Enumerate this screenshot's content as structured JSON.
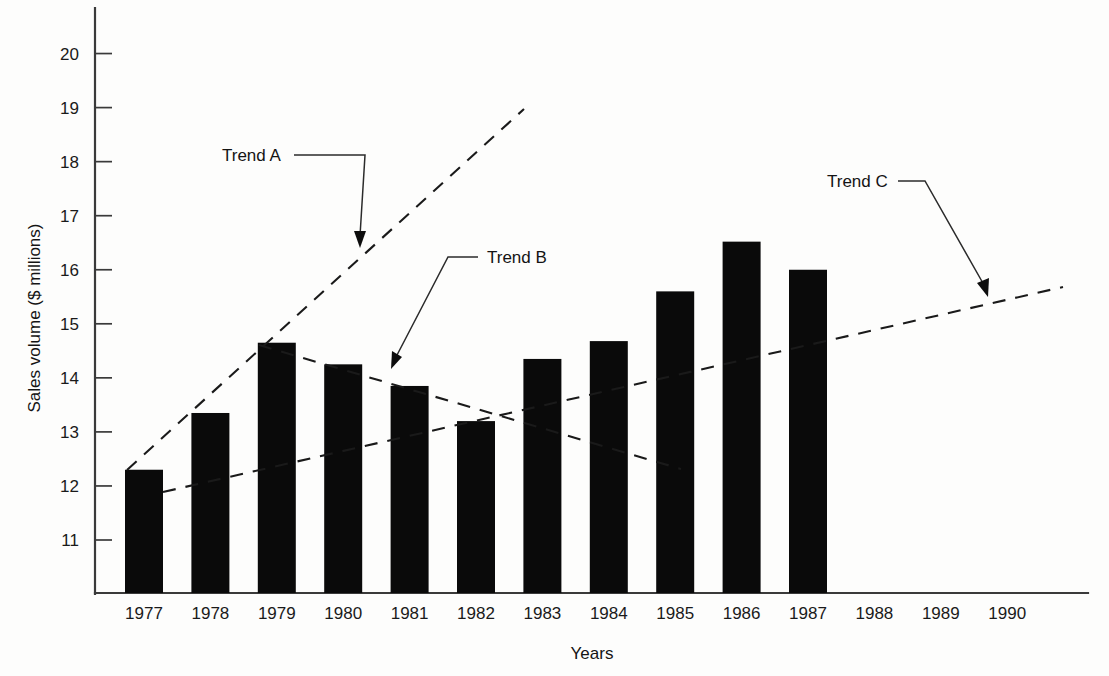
{
  "chart_data": {
    "type": "bar",
    "title": "",
    "xlabel": "Years",
    "ylabel": "Sales volume ($ millions)",
    "categories": [
      "1977",
      "1978",
      "1979",
      "1980",
      "1981",
      "1982",
      "1983",
      "1984",
      "1985",
      "1986",
      "1987",
      "1988",
      "1989",
      "1990"
    ],
    "values": [
      12.3,
      13.35,
      14.65,
      14.25,
      13.85,
      13.2,
      14.35,
      14.68,
      15.6,
      16.52,
      16.0,
      null,
      null,
      null
    ],
    "ylim": [
      10.4,
      20.8
    ],
    "yticks": [
      11,
      12,
      13,
      14,
      15,
      16,
      17,
      18,
      19,
      20
    ],
    "ytick_labels": [
      "11",
      "12",
      "13",
      "14",
      "15",
      "16",
      "17",
      "18",
      "19",
      "20"
    ],
    "grid": false,
    "legend": "none",
    "bar_color": "#0a0a0a",
    "annotations": [
      {
        "label": "Trend A",
        "description": "Rising dashed trend line from 1977 bar top through 1979 bar top continuing upward",
        "line_start": {
          "x": 1977,
          "y": 12.3
        },
        "line_end": {
          "x": 1983.0,
          "y": 18.95
        }
      },
      {
        "label": "Trend B",
        "description": "Declining dashed trend line from 1979 bar top down through 1983",
        "line_start": {
          "x": 1979,
          "y": 14.65
        },
        "line_end": {
          "x": 1985.3,
          "y": 12.45
        }
      },
      {
        "label": "Trend C",
        "description": "Gently rising dashed trend line from 1977 across to 1990",
        "line_start": {
          "x": 1977.5,
          "y": 11.9
        },
        "line_end": {
          "x": 1990.5,
          "y": 15.67
        }
      }
    ]
  },
  "axis": {
    "y_title": "Sales volume ($ millions)",
    "x_title": "Years"
  }
}
